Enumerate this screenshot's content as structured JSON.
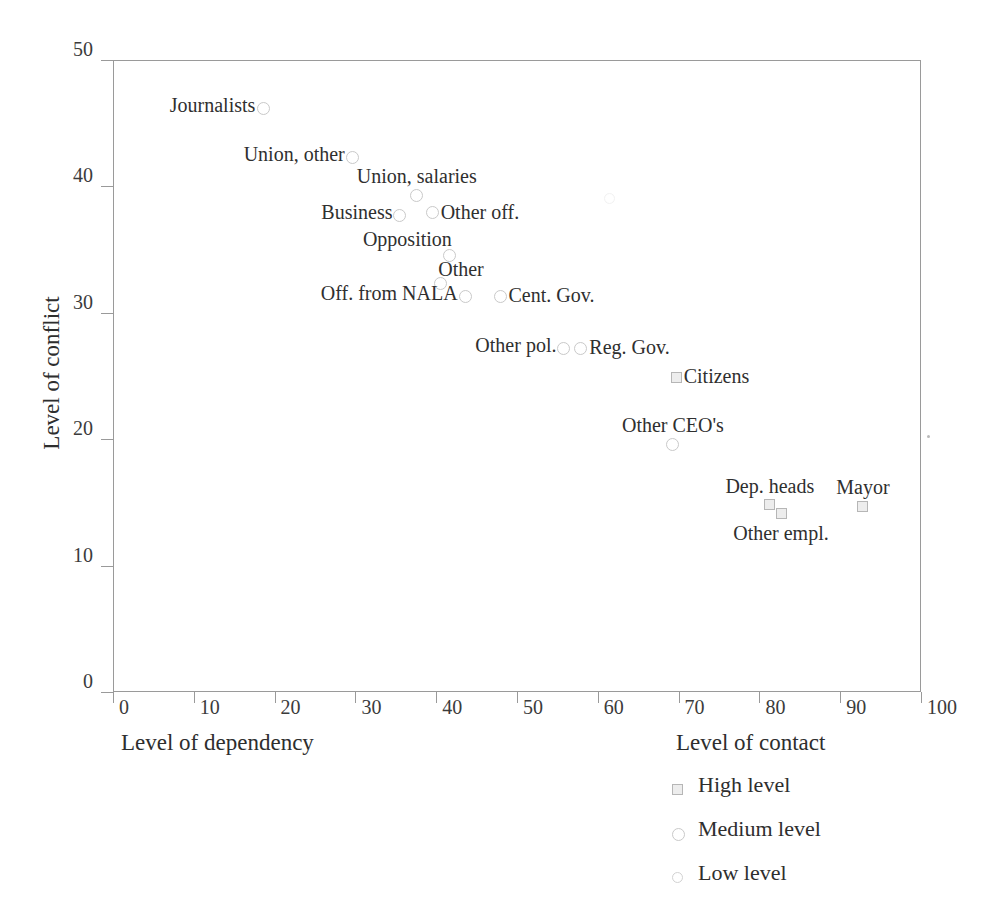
{
  "chart_data": {
    "type": "scatter",
    "title": "",
    "xlabel": "Level of dependency",
    "xlabel_right": "Level of contact",
    "ylabel": "Level of conflict",
    "xlim": [
      0,
      100
    ],
    "ylim": [
      0,
      50
    ],
    "xticks": [
      0,
      10,
      20,
      30,
      40,
      50,
      60,
      70,
      80,
      90,
      100
    ],
    "yticks": [
      0,
      10,
      20,
      30,
      40,
      50
    ],
    "grid": false,
    "legend_position": "bottom-right",
    "points": [
      {
        "label": "Journalists",
        "x": 18.6,
        "y": 46.2,
        "level": "medium",
        "label_pos": "left"
      },
      {
        "label": "Union, other",
        "x": 29.6,
        "y": 42.3,
        "level": "medium",
        "label_pos": "left"
      },
      {
        "label": "Union, salaries",
        "x": 37.6,
        "y": 39.3,
        "level": "medium",
        "label_pos": "above"
      },
      {
        "label": "Business",
        "x": 35.5,
        "y": 37.7,
        "level": "medium",
        "label_pos": "left"
      },
      {
        "label": "Other off.",
        "x": 39.5,
        "y": 37.9,
        "level": "medium",
        "label_pos": "right"
      },
      {
        "label": "Opposition",
        "x": 41.7,
        "y": 34.5,
        "level": "medium",
        "label_pos": "above-left"
      },
      {
        "label": "Other",
        "x": 40.5,
        "y": 32.3,
        "level": "medium",
        "label_pos": "above-right"
      },
      {
        "label": "Off. from NALA",
        "x": 43.6,
        "y": 31.3,
        "level": "medium",
        "label_pos": "left"
      },
      {
        "label": "Cent. Gov.",
        "x": 47.9,
        "y": 31.3,
        "level": "medium",
        "label_pos": "right"
      },
      {
        "label": "Other pol.",
        "x": 55.8,
        "y": 27.2,
        "level": "medium",
        "label_pos": "left"
      },
      {
        "label": "Reg. Gov.",
        "x": 57.9,
        "y": 27.2,
        "level": "medium",
        "label_pos": "right"
      },
      {
        "label": "Citizens",
        "x": 69.7,
        "y": 24.9,
        "level": "high",
        "label_pos": "right"
      },
      {
        "label": "Other CEO's",
        "x": 69.3,
        "y": 19.6,
        "level": "medium",
        "label_pos": "above"
      },
      {
        "label": "Dep. heads",
        "x": 81.3,
        "y": 14.8,
        "level": "high",
        "label_pos": "above"
      },
      {
        "label": "Other empl.",
        "x": 82.7,
        "y": 14.1,
        "level": "high",
        "label_pos": "below"
      },
      {
        "label": "Mayor",
        "x": 92.8,
        "y": 14.7,
        "level": "high",
        "label_pos": "above"
      }
    ],
    "legend": [
      {
        "key": "high",
        "label": "High level",
        "marker": "square"
      },
      {
        "key": "medium",
        "label": "Medium level",
        "marker": "circle"
      },
      {
        "key": "low",
        "label": "Low level",
        "marker": "circle-small"
      }
    ],
    "colors": {
      "axis": "#9a9a9a",
      "text": "#2e2e2e",
      "marker_medium": "#c9c9c9",
      "marker_low": "#d2d2d2",
      "marker_high_border": "#b6b6b6",
      "marker_high_fill": "#ededed",
      "background": "#ffffff"
    }
  }
}
